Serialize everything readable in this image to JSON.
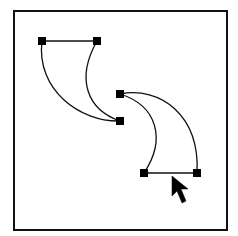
{
  "figure": {
    "colors": {
      "stroke": "#111111",
      "background": "#ffffff",
      "anchor": "#000000"
    }
  },
  "frame": {
    "x": 14,
    "y": 11,
    "width": 213,
    "height": 219
  },
  "path_1": {
    "anchors": [
      {
        "x": 42,
        "y": 41
      },
      {
        "x": 97,
        "y": 41
      },
      {
        "x": 120,
        "y": 121
      }
    ]
  },
  "path_2": {
    "anchors": [
      {
        "x": 120,
        "y": 94
      },
      {
        "x": 144,
        "y": 173
      },
      {
        "x": 197,
        "y": 173
      }
    ]
  },
  "cursor": {
    "icon": "arrow-pointer-icon",
    "tip": {
      "x": 172,
      "y": 176
    }
  }
}
